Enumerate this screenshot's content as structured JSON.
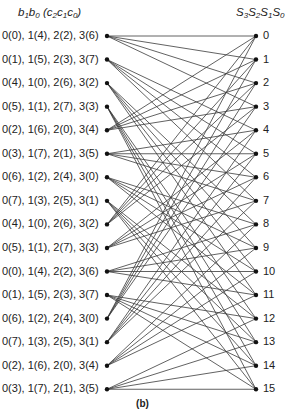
{
  "left_header": {
    "parts": [
      [
        "b",
        "1"
      ],
      [
        "b",
        "0"
      ],
      [
        " (",
        ""
      ],
      [
        "c",
        "2"
      ],
      [
        "c",
        "1"
      ],
      [
        "c",
        "0"
      ],
      [
        ")",
        ""
      ]
    ]
  },
  "right_header": {
    "parts": [
      [
        "S",
        "3"
      ],
      [
        "S",
        "2"
      ],
      [
        "S",
        "1"
      ],
      [
        "S",
        "0"
      ]
    ]
  },
  "left_states": [
    "0(0), 1(4), 2(2), 3(6)",
    "0(1), 1(5), 2(3), 3(7)",
    "0(4), 1(0), 2(6), 3(2)",
    "0(5), 1(1), 2(7), 3(3)",
    "0(2), 1(6), 2(0), 3(4)",
    "0(3), 1(7), 2(1), 3(5)",
    "0(6), 1(2), 2(4), 3(0)",
    "0(7), 1(3), 2(5), 3(1)",
    "0(4), 1(0), 2(6), 3(2)",
    "0(5), 1(1), 2(7), 3(3)",
    "0(0), 1(4), 2(2), 3(6)",
    "0(1), 1(5), 2(3), 3(7)",
    "0(6), 1(2), 2(4), 3(0)",
    "0(7), 1(3), 2(5), 3(1)",
    "0(2), 1(6), 2(0), 3(4)",
    "0(3), 1(7), 2(1), 3(5)"
  ],
  "right_states": [
    "0",
    "1",
    "2",
    "3",
    "4",
    "5",
    "6",
    "7",
    "8",
    "9",
    "10",
    "11",
    "12",
    "13",
    "14",
    "15"
  ],
  "caption": "(b)",
  "colors": {
    "edge": "#3a3a3a",
    "node": "#111111",
    "text": "#222222"
  },
  "layout": {
    "left_x": 107,
    "right_x": 256,
    "top_y": 36,
    "row_step": 23.55
  },
  "edges_rule": "left state i connects to right states (4*i mod 16) + {0,1,2,3}"
}
